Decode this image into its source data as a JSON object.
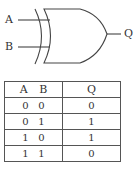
{
  "diagram": {
    "gate_type": "XOR",
    "inputs": [
      "A",
      "B"
    ],
    "output": "Q"
  },
  "truth_table": {
    "headers": {
      "a": "A",
      "b": "B",
      "q": "Q"
    },
    "rows": [
      {
        "a": "0",
        "b": "0",
        "q": "0"
      },
      {
        "a": "0",
        "b": "1",
        "q": "1"
      },
      {
        "a": "1",
        "b": "0",
        "q": "1"
      },
      {
        "a": "1",
        "b": "1",
        "q": "0"
      }
    ]
  }
}
